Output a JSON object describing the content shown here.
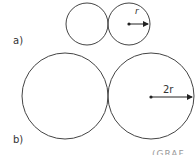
{
  "diagram": {
    "part_a": {
      "label": "a)",
      "arrow_label": "r"
    },
    "part_b": {
      "label": "b)",
      "arrow_label": "2r"
    },
    "footer_fragment": "(GRAF"
  }
}
